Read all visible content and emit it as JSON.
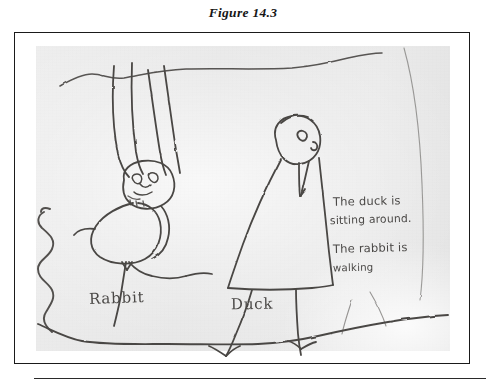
{
  "figure": {
    "caption": "Figure 14.3",
    "kind": "scanned-childs-drawing"
  },
  "drawing": {
    "title": "Child's pencil drawing of a rabbit and a duck",
    "labels": {
      "rabbit": "Rabbit",
      "duck": "Duck"
    },
    "handwritten_note": {
      "line1": "The duck is",
      "line2": "sitting around.",
      "line3": "The rabbit is",
      "line4": "walking"
    },
    "elements": [
      "horizon-line",
      "left-squiggle",
      "rabbit-figure",
      "duck-figure",
      "ground-line",
      "right-curve"
    ]
  },
  "colors": {
    "page_background": "#ffffff",
    "frame_border": "#1a1a1a",
    "photo_paper": "#e9e9e9",
    "pencil_stroke": "#3a3a3a",
    "caption_text": "#161616"
  }
}
